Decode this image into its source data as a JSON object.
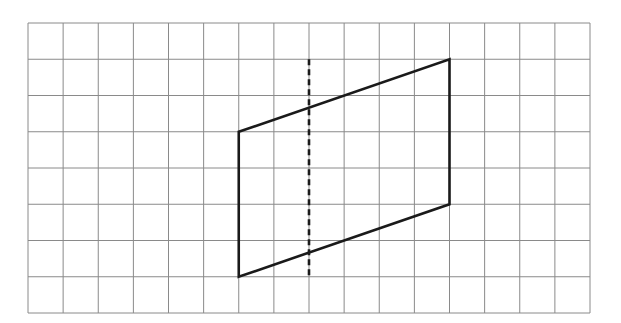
{
  "grid": {
    "columns": 16,
    "rows": 8,
    "origin_px": [
      28,
      23
    ],
    "cell_width_px": 35.125,
    "cell_height_px": 36.25,
    "line_color": "#8a8a8a"
  },
  "shape": {
    "type": "parallelogram",
    "vertices_grid": [
      [
        6,
        3
      ],
      [
        12,
        1
      ],
      [
        12,
        5
      ],
      [
        6,
        7
      ]
    ],
    "stroke_color": "#1a1a1a",
    "stroke_width": 2.6
  },
  "dashed_line": {
    "orientation": "vertical",
    "x_grid": 8,
    "y_from_grid": 1,
    "y_to_grid": 7,
    "stroke_color": "#1a1a1a",
    "stroke_width": 2.6,
    "dash": "6 4"
  }
}
